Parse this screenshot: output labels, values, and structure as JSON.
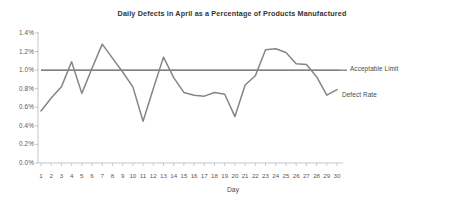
{
  "chart_data": {
    "type": "line",
    "title": "Daily Defects in April as a Percentage of Products Manufactured",
    "xlabel": "Day",
    "ylabel": "",
    "x": [
      1,
      2,
      3,
      4,
      5,
      6,
      7,
      8,
      9,
      10,
      11,
      12,
      13,
      14,
      15,
      16,
      17,
      18,
      19,
      20,
      21,
      22,
      23,
      24,
      25,
      26,
      27,
      28,
      29,
      30
    ],
    "categories": [
      "1",
      "2",
      "3",
      "4",
      "5",
      "6",
      "7",
      "8",
      "9",
      "10",
      "11",
      "12",
      "13",
      "14",
      "15",
      "16",
      "17",
      "18",
      "19",
      "20",
      "21",
      "22",
      "23",
      "24",
      "25",
      "26",
      "27",
      "28",
      "29",
      "30"
    ],
    "series": [
      {
        "name": "Defect Rate",
        "values": [
          0.56,
          0.7,
          0.82,
          1.09,
          0.75,
          1.02,
          1.28,
          1.13,
          0.98,
          0.82,
          0.45,
          0.8,
          1.14,
          0.92,
          0.76,
          0.73,
          0.72,
          0.76,
          0.74,
          0.5,
          0.84,
          0.94,
          1.22,
          1.23,
          1.19,
          1.07,
          1.06,
          0.93,
          0.73,
          0.79
        ]
      },
      {
        "name": "Acceptable Limit",
        "values": [
          1.0,
          1.0,
          1.0,
          1.0,
          1.0,
          1.0,
          1.0,
          1.0,
          1.0,
          1.0,
          1.0,
          1.0,
          1.0,
          1.0,
          1.0,
          1.0,
          1.0,
          1.0,
          1.0,
          1.0,
          1.0,
          1.0,
          1.0,
          1.0,
          1.0,
          1.0,
          1.0,
          1.0,
          1.0,
          1.0
        ]
      }
    ],
    "ylim": [
      0.0,
      1.4
    ],
    "ytick_labels": [
      "1.4%",
      "1.2%",
      "1.0%",
      "0.8%",
      "0.6%",
      "0.4%",
      "0.2%",
      "0.0%"
    ],
    "ytick_values": [
      1.4,
      1.2,
      1.0,
      0.8,
      0.6,
      0.4,
      0.2,
      0.0
    ],
    "grid": false,
    "legend_position": "right-inline",
    "colors": {
      "defect_rate_line": "#808080",
      "acceptable_limit_line": "#595959",
      "axis": "#b0b0b0",
      "text": "#4a4a4a",
      "background": "#ffffff"
    }
  },
  "legend": {
    "acceptable_limit_label": "Acceptable Limit",
    "defect_rate_label": "Defect Rate"
  }
}
